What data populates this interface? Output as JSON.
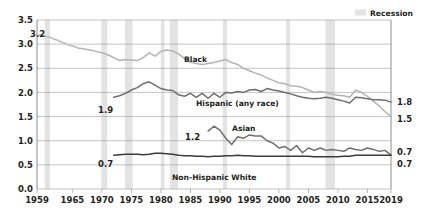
{
  "legend": {
    "position": "top-right",
    "entries": [
      {
        "label": "Recession",
        "swatch_color": "#e3e3e3",
        "name": "recession-legend"
      }
    ]
  },
  "axes": {
    "y_ticks": [
      "0.0",
      "0.5",
      "1.0",
      "1.5",
      "2.0",
      "2.5",
      "3.0",
      "3.5"
    ],
    "x_ticks": [
      "1959",
      "1965",
      "1970",
      "1975",
      "1980",
      "1985",
      "1990",
      "1995",
      "2000",
      "2005",
      "2010",
      "2015",
      "2019"
    ]
  },
  "annotations": {
    "start_black": "3.2",
    "start_hispanic": "1.9",
    "start_asian": "1.2",
    "start_white": "0.7",
    "end_hispanic": "1.8",
    "end_black": "1.5",
    "end_asian": "0.7",
    "end_white": "0.7"
  },
  "series_labels": {
    "black": "Black",
    "hispanic": "Hispanic (any race)",
    "asian": "Asian",
    "white": "Non-Hispanic White"
  },
  "chart_data": {
    "type": "line",
    "title": "",
    "xlabel": "",
    "ylabel": "",
    "xlim": [
      1959,
      2019
    ],
    "ylim": [
      0.0,
      3.5
    ],
    "grid": "horizontal",
    "legend_position": "top-right",
    "x_tick_values": [
      1959,
      1965,
      1970,
      1975,
      1980,
      1985,
      1990,
      1995,
      2000,
      2005,
      2010,
      2015,
      2019
    ],
    "y_tick_values": [
      0.0,
      0.5,
      1.0,
      1.5,
      2.0,
      2.5,
      3.0,
      3.5
    ],
    "recession_bands": [
      [
        1960.3,
        1961.2
      ],
      [
        1969.9,
        1970.9
      ],
      [
        1973.9,
        1975.2
      ],
      [
        1980.0,
        1980.6
      ],
      [
        1981.5,
        1982.9
      ],
      [
        1990.5,
        1991.2
      ],
      [
        2001.2,
        2001.9
      ],
      [
        2007.9,
        2009.5
      ]
    ],
    "series": [
      {
        "name": "Black",
        "color": "#b3b3b3",
        "start_value": 3.2,
        "end_value": 1.5,
        "x": [
          1959,
          1960,
          1961,
          1962,
          1963,
          1964,
          1965,
          1966,
          1967,
          1968,
          1969,
          1970,
          1971,
          1972,
          1973,
          1974,
          1975,
          1976,
          1977,
          1978,
          1979,
          1980,
          1981,
          1982,
          1983,
          1984,
          1985,
          1986,
          1987,
          1988,
          1989,
          1990,
          1991,
          1992,
          1993,
          1994,
          1995,
          1996,
          1997,
          1998,
          1999,
          2000,
          2001,
          2002,
          2003,
          2004,
          2005,
          2006,
          2007,
          2008,
          2009,
          2010,
          2011,
          2012,
          2013,
          2014,
          2015,
          2016,
          2017,
          2018,
          2019
        ],
        "values": [
          3.2,
          3.18,
          3.15,
          3.1,
          3.05,
          3.0,
          2.96,
          2.92,
          2.9,
          2.88,
          2.85,
          2.82,
          2.78,
          2.72,
          2.66,
          2.68,
          2.67,
          2.66,
          2.72,
          2.82,
          2.75,
          2.85,
          2.88,
          2.86,
          2.8,
          2.7,
          2.63,
          2.6,
          2.58,
          2.6,
          2.62,
          2.65,
          2.68,
          2.62,
          2.58,
          2.5,
          2.45,
          2.4,
          2.36,
          2.3,
          2.25,
          2.2,
          2.18,
          2.14,
          2.13,
          2.1,
          2.05,
          2.0,
          2.02,
          2.0,
          1.96,
          1.94,
          1.93,
          1.9,
          2.05,
          2.0,
          1.92,
          1.82,
          1.72,
          1.6,
          1.5
        ]
      },
      {
        "name": "Hispanic (any race)",
        "color": "#6e6e6e",
        "start_value": 1.9,
        "end_value": 1.8,
        "x": [
          1972,
          1973,
          1974,
          1975,
          1976,
          1977,
          1978,
          1979,
          1980,
          1981,
          1982,
          1983,
          1984,
          1985,
          1986,
          1987,
          1988,
          1989,
          1990,
          1991,
          1992,
          1993,
          1994,
          1995,
          1996,
          1997,
          1998,
          1999,
          2000,
          2001,
          2002,
          2003,
          2004,
          2005,
          2006,
          2007,
          2008,
          2009,
          2010,
          2011,
          2012,
          2013,
          2014,
          2015,
          2016,
          2017,
          2018,
          2019
        ],
        "values": [
          1.9,
          1.93,
          1.98,
          2.05,
          2.1,
          2.18,
          2.22,
          2.15,
          2.08,
          2.05,
          2.04,
          1.95,
          1.92,
          1.98,
          1.9,
          1.98,
          1.88,
          1.98,
          1.9,
          2.0,
          1.99,
          2.02,
          2.0,
          2.05,
          2.06,
          2.02,
          2.08,
          2.05,
          2.03,
          2.0,
          1.97,
          1.93,
          1.9,
          1.88,
          1.87,
          1.88,
          1.9,
          1.88,
          1.85,
          1.82,
          1.78,
          1.9,
          1.89,
          1.87,
          1.85,
          1.85,
          1.84,
          1.8
        ]
      },
      {
        "name": "Asian",
        "color": "#6e6e6e",
        "start_value": 1.2,
        "end_value": 0.7,
        "x": [
          1988,
          1989,
          1990,
          1991,
          1992,
          1993,
          1994,
          1995,
          1996,
          1997,
          1998,
          1999,
          2000,
          2001,
          2002,
          2003,
          2004,
          2005,
          2006,
          2007,
          2008,
          2009,
          2010,
          2011,
          2012,
          2013,
          2014,
          2015,
          2016,
          2017,
          2018,
          2019
        ],
        "values": [
          1.2,
          1.3,
          1.22,
          1.05,
          0.92,
          1.08,
          1.05,
          1.12,
          1.1,
          1.1,
          1.0,
          0.95,
          0.85,
          0.88,
          0.8,
          0.9,
          0.75,
          0.85,
          0.8,
          0.85,
          0.8,
          0.82,
          0.8,
          0.78,
          0.85,
          0.82,
          0.8,
          0.85,
          0.82,
          0.78,
          0.8,
          0.7
        ]
      },
      {
        "name": "Non-Hispanic White",
        "color": "#3b3b3b",
        "start_value": 0.7,
        "end_value": 0.7,
        "x": [
          1972,
          1973,
          1974,
          1975,
          1976,
          1977,
          1978,
          1979,
          1980,
          1981,
          1982,
          1983,
          1984,
          1985,
          1986,
          1987,
          1988,
          1989,
          1990,
          1991,
          1992,
          1993,
          1994,
          1995,
          1996,
          1997,
          1998,
          1999,
          2000,
          2001,
          2002,
          2003,
          2004,
          2005,
          2006,
          2007,
          2008,
          2009,
          2010,
          2011,
          2012,
          2013,
          2014,
          2015,
          2016,
          2017,
          2018,
          2019
        ],
        "values": [
          0.7,
          0.71,
          0.72,
          0.72,
          0.72,
          0.71,
          0.72,
          0.74,
          0.74,
          0.73,
          0.72,
          0.7,
          0.69,
          0.69,
          0.68,
          0.68,
          0.67,
          0.68,
          0.68,
          0.69,
          0.69,
          0.7,
          0.69,
          0.69,
          0.68,
          0.68,
          0.68,
          0.68,
          0.68,
          0.68,
          0.68,
          0.68,
          0.68,
          0.68,
          0.67,
          0.67,
          0.67,
          0.67,
          0.67,
          0.68,
          0.68,
          0.7,
          0.7,
          0.7,
          0.7,
          0.7,
          0.7,
          0.7
        ]
      }
    ]
  }
}
